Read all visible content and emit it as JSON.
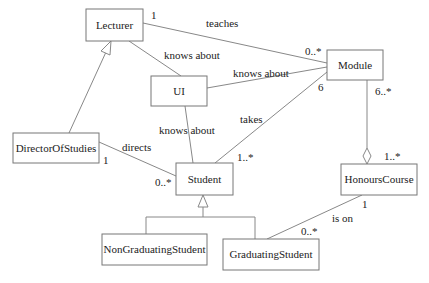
{
  "diagram": {
    "type": "UML class diagram",
    "classes": {
      "lecturer": "Lecturer",
      "ui": "UI",
      "module": "Module",
      "director": "DirectorOfStudies",
      "student": "Student",
      "honours": "HonoursCourse",
      "nongrad": "NonGraduatingStudent",
      "grad": "GraduatingStudent"
    },
    "associations": {
      "teaches": {
        "label": "teaches",
        "from_mult": "1",
        "to_mult": "0..*"
      },
      "lecturer_ui": {
        "label": "knows about"
      },
      "ui_module": {
        "label": "knows about"
      },
      "ui_student": {
        "label": "knows about"
      },
      "takes": {
        "label": "takes",
        "from_mult": "1..*",
        "to_mult": "6"
      },
      "directs": {
        "label": "directs",
        "from_mult": "1",
        "to_mult": "0..*"
      },
      "aggregation": {
        "from_mult": "6..*",
        "to_mult": "1..*"
      },
      "is_on": {
        "label": "is on",
        "from_mult": "1",
        "to_mult": "0..*"
      }
    }
  }
}
